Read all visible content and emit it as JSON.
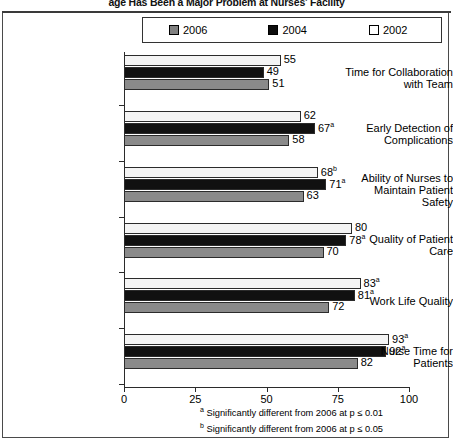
{
  "title": "age Has Been a Major Problem at Nurses' Facility",
  "legend": {
    "position": "top",
    "entries": [
      {
        "label": "2006",
        "color": "#808080"
      },
      {
        "label": "2004",
        "color": "#0d0d0d"
      },
      {
        "label": "2002",
        "color": "#ffffff"
      }
    ]
  },
  "footnotes": [
    {
      "marker": "a",
      "text": "Significantly different from 2006 at p ≤ 0.01"
    },
    {
      "marker": "b",
      "text": "Significantly different from 2006 at p ≤ 0.05"
    }
  ],
  "chart_data": {
    "type": "bar",
    "orientation": "horizontal",
    "title": "age Has Been a Major Problem at Nurses' Facility",
    "xlabel": "",
    "ylabel": "",
    "xlim": [
      0,
      100
    ],
    "xticks": [
      "0",
      "25",
      "50",
      "75",
      "100"
    ],
    "grid": false,
    "legend_position": "top",
    "categories": [
      "Time for Collaboration with Team",
      "Early Detection of Complications",
      "Ability of Nurses to Maintain Patient Safety",
      "Quality of Patient Care",
      "Work Life Quality",
      "Nurse Time for Patients"
    ],
    "series": [
      {
        "name": "2002",
        "color": "#f4f4f4",
        "values": [
          55,
          62,
          68,
          80,
          83,
          93
        ],
        "labels": [
          "55",
          "62",
          "68",
          "80",
          "83",
          "93"
        ],
        "markers": [
          "",
          "",
          "b",
          "",
          "a",
          "a"
        ]
      },
      {
        "name": "2004",
        "color": "#111111",
        "values": [
          49,
          67,
          71,
          78,
          81,
          92
        ],
        "labels": [
          "49",
          "67",
          "71",
          "78",
          "81",
          "92"
        ],
        "markers": [
          "",
          "a",
          "a",
          "a",
          "a",
          "a"
        ]
      },
      {
        "name": "2006",
        "color": "#8a8a8a",
        "values": [
          51,
          58,
          63,
          70,
          72,
          82
        ],
        "labels": [
          "51",
          "58",
          "63",
          "70",
          "72",
          "82"
        ],
        "markers": [
          "",
          "",
          "",
          "",
          "",
          ""
        ]
      }
    ]
  },
  "categories_display": [
    [
      "Time for Collaboration",
      "with Team"
    ],
    [
      "Early Detection of",
      "Complications"
    ],
    [
      "Ability of Nurses to",
      "Maintain Patient",
      "Safety"
    ],
    [
      "Quality of Patient",
      "Care"
    ],
    [
      "Work Life Quality"
    ],
    [
      "Nurse Time for",
      "Patients"
    ]
  ]
}
